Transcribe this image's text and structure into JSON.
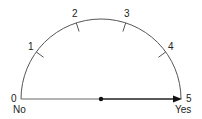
{
  "diagram": {
    "type": "semicircular-scale",
    "scale_labels": [
      "0",
      "1",
      "2",
      "3",
      "4",
      "5"
    ],
    "left_label": "No",
    "right_label": "Yes",
    "indicator": {
      "from_value": 2.5,
      "to_value": 5,
      "style": "arrow"
    },
    "colors": {
      "line": "#333333",
      "text": "#222222"
    }
  }
}
